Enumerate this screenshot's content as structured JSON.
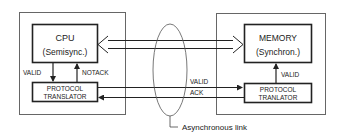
{
  "diagram": {
    "left_node": {
      "processor": {
        "title": "CPU",
        "subtitle": "(Semisync.)"
      },
      "translator": {
        "line1": "PROTOCOL",
        "line2": "TRANSLATOR"
      },
      "signals": {
        "down": "VALID",
        "up": "NOTACK"
      }
    },
    "right_node": {
      "processor": {
        "title": "MEMORY",
        "subtitle": "(Synchron.)"
      },
      "translator": {
        "line1": "PROTOCOL",
        "line2": "TRANLATOR"
      },
      "signals": {
        "up": "VALID"
      }
    },
    "link": {
      "signal_top": "VALID",
      "signal_bottom": "ACK",
      "callout": "Asynchronous link"
    },
    "colors": {
      "line": "#2a2a2a",
      "outer_box": "#666666",
      "background": "#ffffff"
    }
  }
}
